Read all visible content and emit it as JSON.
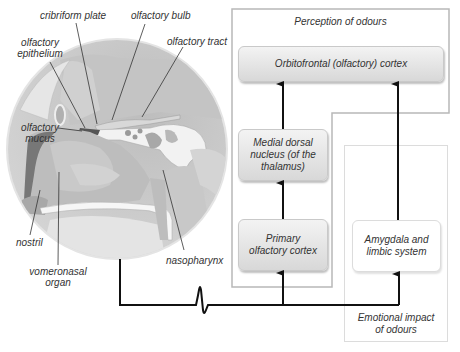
{
  "diagram": {
    "anatomy_labels": {
      "cribriform_plate": "cribriform plate",
      "olfactory_bulb": "olfactory bulb",
      "olfactory_tract": "olfactory tract",
      "olfactory_epithelium_1": "olfactory",
      "olfactory_epithelium_2": "epithelium",
      "olfactory_mucus_1": "olfactory",
      "olfactory_mucus_2": "mucus",
      "nostril": "nostril",
      "vomeronasal_organ_1": "vomeronasal",
      "vomeronasal_organ_2": "organ",
      "nasopharynx": "nasopharynx"
    },
    "regions": {
      "perception": {
        "title": "Perception of odours"
      },
      "emotional": {
        "title_1": "Emotional impact",
        "title_2": "of odours"
      }
    },
    "nodes": {
      "orbitofrontal": {
        "label": "Orbitofrontal (olfactory) cortex"
      },
      "medial_dorsal": {
        "line1": "Medial dorsal",
        "line2": "nucleus (of the",
        "line3": "thalamus)"
      },
      "primary": {
        "line1": "Primary",
        "line2": "olfactory cortex"
      },
      "amygdala": {
        "line1": "Amygdala and",
        "line2": "limbic system"
      }
    },
    "colors": {
      "line": "#111111",
      "region_border": "#b8b8b8",
      "node_grey_top": "#f3f3f3",
      "node_grey_bottom": "#d8d8d8",
      "circle_fill": "#d6d6d6"
    }
  }
}
